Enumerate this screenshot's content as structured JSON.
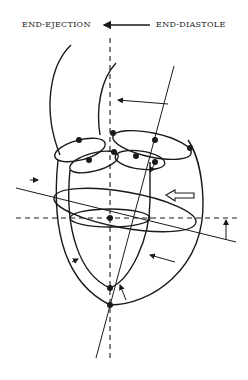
{
  "labels": {
    "left": "END-EJECTION",
    "right": "END-DIASTOLE"
  },
  "colors": {
    "stroke": "#1a1a1a",
    "background": "#ffffff"
  }
}
